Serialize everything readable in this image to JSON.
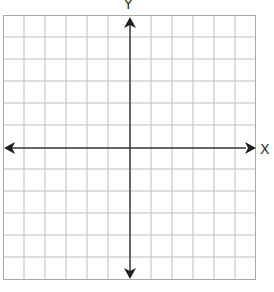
{
  "diagram": {
    "type": "coordinate-plane",
    "x_axis_label": "X",
    "y_axis_label": "Y",
    "grid": {
      "columns": 12,
      "rows": 12,
      "line_color": "#b5b5b5",
      "border_color": "#a8a8a8"
    },
    "axis_color": "#333333",
    "caption_partial": ""
  }
}
